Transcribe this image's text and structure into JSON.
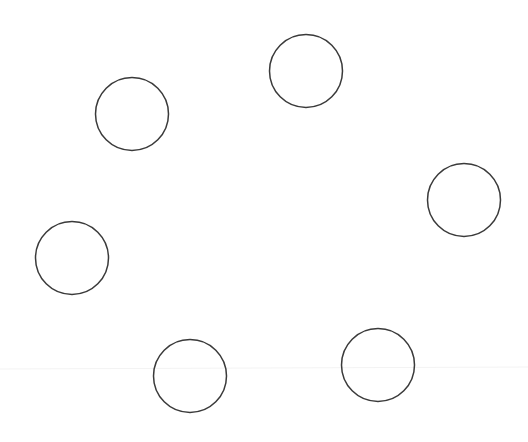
{
  "canvas": {
    "width": 528,
    "height": 442,
    "background": "#ffffff"
  },
  "style": {
    "stroke_color": "#3a3a3a",
    "stroke_width": 1.5,
    "fill": "none",
    "faint_line_color": "#f3f3f3"
  },
  "faint_line": {
    "x1": 0,
    "y1": 369,
    "x2": 528,
    "y2": 367
  },
  "circles": [
    {
      "id": "circle-1",
      "cx": 132,
      "cy": 114,
      "r": 36.5
    },
    {
      "id": "circle-2",
      "cx": 306,
      "cy": 71,
      "r": 36.5
    },
    {
      "id": "circle-3",
      "cx": 464,
      "cy": 200,
      "r": 36.5
    },
    {
      "id": "circle-4",
      "cx": 72,
      "cy": 258,
      "r": 36.5
    },
    {
      "id": "circle-5",
      "cx": 190,
      "cy": 376,
      "r": 36.5
    },
    {
      "id": "circle-6",
      "cx": 378,
      "cy": 365,
      "r": 36.5
    }
  ]
}
